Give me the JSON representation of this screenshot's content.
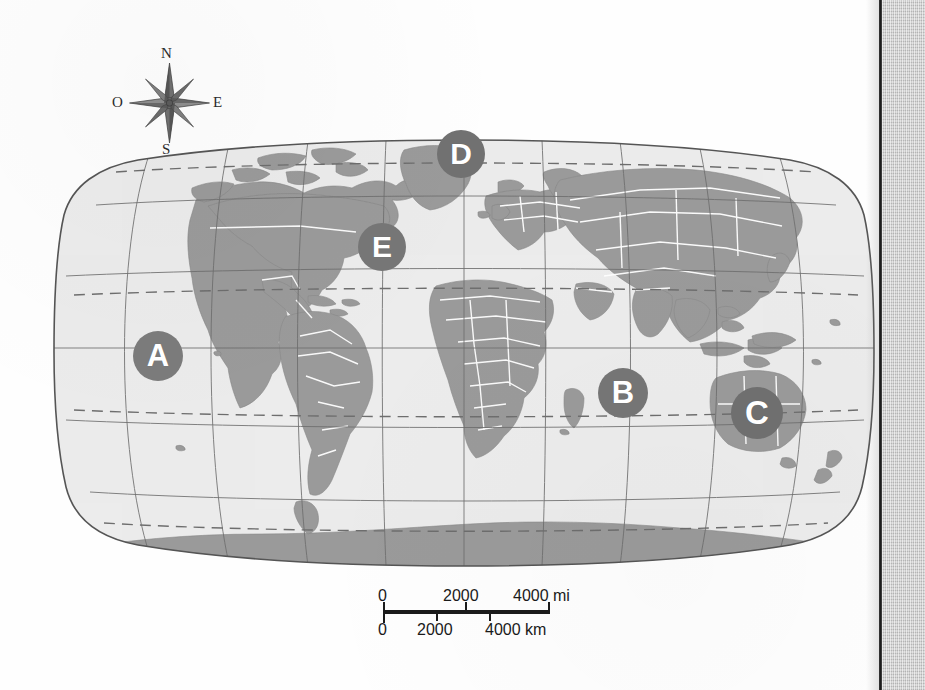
{
  "map": {
    "title": "World physical-political outline map",
    "projection": "Robinson",
    "ocean_color": "#ececec",
    "land_color": "#9a9a9a",
    "border_color": "#ffffff",
    "graticule_color": "#6e6e6e",
    "special_line_color": "#6e6e6e",
    "outline_color": "#555555"
  },
  "compass": {
    "name": "compass-rose",
    "north": "N",
    "south": "S",
    "east": "E",
    "west": "O"
  },
  "markers": [
    {
      "id": "A",
      "label": "A",
      "x": 158,
      "y": 356,
      "r": 25,
      "color": "#7b7b7b",
      "region": "Pacific Ocean"
    },
    {
      "id": "B",
      "label": "B",
      "x": 623,
      "y": 393,
      "r": 25,
      "color": "#757575",
      "region": "Indian Ocean"
    },
    {
      "id": "C",
      "label": "C",
      "x": 757,
      "y": 413,
      "r": 26,
      "color": "#6f6f6f",
      "region": "Australia"
    },
    {
      "id": "D",
      "label": "D",
      "x": 461,
      "y": 154,
      "r": 24,
      "color": "#717171",
      "region": "North Atlantic / Greenland"
    },
    {
      "id": "E",
      "label": "E",
      "x": 382,
      "y": 247,
      "r": 24,
      "color": "#767676",
      "region": "North Atlantic Ocean"
    }
  ],
  "scalebar": {
    "name": "map-scale-bar",
    "miles": {
      "unit": "mi",
      "ticks": [
        "0",
        "2000",
        "4000 mi"
      ]
    },
    "kilometers": {
      "unit": "km",
      "ticks": [
        "0",
        "2000",
        "4000 km"
      ]
    }
  },
  "page_edge": {
    "name": "book-page-edge",
    "strip_color": "#c9c9c9",
    "line_color": "#2a2a2a"
  }
}
